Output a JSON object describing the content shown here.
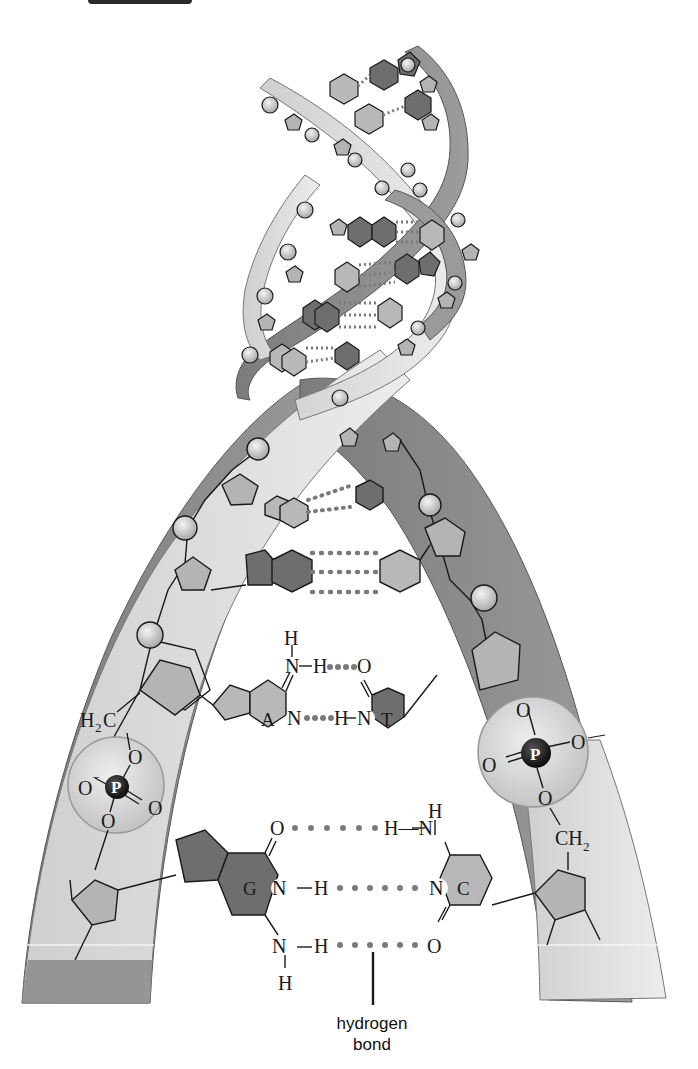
{
  "figure": {
    "caption_line1": "hydrogen",
    "caption_line2": "bond"
  },
  "colors": {
    "background": "#ffffff",
    "strand_light": "#d9d9d9",
    "strand_dark": "#8a8a8a",
    "sugar": "#b4b4b4",
    "purine_dark": "#6e6e6e",
    "pyrimidine_light": "#b8b8b8",
    "phosphate_bead": "#d0d0d0",
    "phosphorus": "#222222",
    "hbond_dot": "#7a7a7a",
    "line": "#1a1a1a"
  },
  "base_pairs": {
    "at": {
      "left_base": "A",
      "right_base": "T",
      "hbonds": 2
    },
    "gc": {
      "left_base": "G",
      "right_base": "C",
      "hbonds": 3
    }
  },
  "labels": {
    "h": "H",
    "n": "N",
    "o": "O",
    "p": "P",
    "nh": "N—H",
    "hn": "H—N",
    "h2c_main": "H",
    "h2c_sub": "2",
    "h2c_tail": "C",
    "ch2_main": "CH",
    "ch2_sub": "2",
    "o_minus": "O",
    "minus": "−"
  }
}
